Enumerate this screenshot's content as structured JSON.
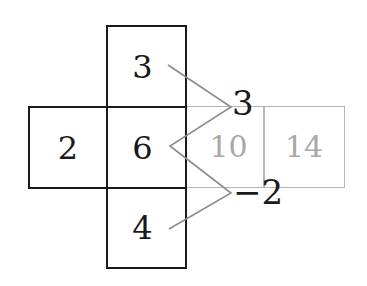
{
  "diagram": {
    "type": "cube-net-with-sums",
    "net_faces": {
      "top": "3",
      "left": "2",
      "center": "6",
      "bottom": "4"
    },
    "ghost_faces": {
      "right_1": "10",
      "right_2": "14"
    },
    "operation_labels": {
      "upper": "3",
      "lower": "−2"
    },
    "colors": {
      "ink": "#1a1a1a",
      "ghost_border": "#b5b5b5",
      "ghost_text": "#a8a8a8",
      "connector": "#8c8c8c"
    }
  }
}
